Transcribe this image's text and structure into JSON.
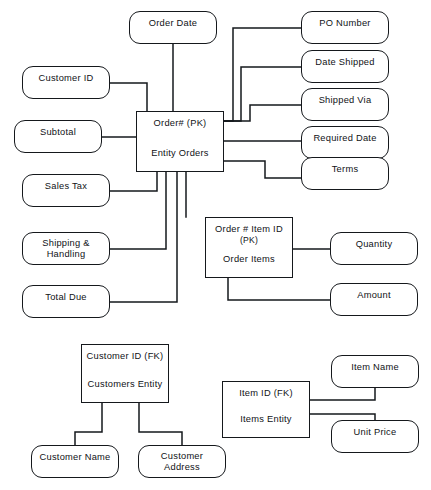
{
  "diagram": {
    "stroke_color": "#15181c",
    "background_color": "#ffffff"
  },
  "entities": [
    {
      "id": "orders",
      "key_line": "Order# (PK)",
      "name_line": "Entity Orders",
      "x": 136,
      "y": 111,
      "w": 88,
      "h": 61
    },
    {
      "id": "order_items",
      "key_line": "Order # Item ID",
      "sub_line": "(PK)",
      "name_line": "Order Items",
      "x": 205,
      "y": 217,
      "w": 88,
      "h": 61
    },
    {
      "id": "customers",
      "key_line": "Customer ID (FK)",
      "name_line": "Customers Entity",
      "x": 81,
      "y": 344,
      "w": 88,
      "h": 59
    },
    {
      "id": "items",
      "key_line": "Item ID (FK)",
      "name_line": "Items Entity",
      "x": 222,
      "y": 381,
      "w": 88,
      "h": 57
    }
  ],
  "attributes": [
    {
      "id": "order_date",
      "label": "Order Date",
      "x": 129,
      "y": 11,
      "w": 88,
      "h": 33
    },
    {
      "id": "po_number",
      "label": "PO Number",
      "x": 301,
      "y": 11,
      "w": 88,
      "h": 33
    },
    {
      "id": "date_shipped",
      "label": "Date Shipped",
      "x": 301,
      "y": 50,
      "w": 88,
      "h": 33
    },
    {
      "id": "shipped_via",
      "label": "Shipped Via",
      "x": 301,
      "y": 88,
      "w": 88,
      "h": 33
    },
    {
      "id": "required_date",
      "label": "Required Date",
      "x": 301,
      "y": 126,
      "w": 88,
      "h": 33
    },
    {
      "id": "terms",
      "label": "Terms",
      "x": 301,
      "y": 157,
      "w": 88,
      "h": 33
    },
    {
      "id": "customer_id",
      "label": "Customer ID",
      "x": 22,
      "y": 66,
      "w": 88,
      "h": 33
    },
    {
      "id": "subtotal",
      "label": "Subtotal",
      "x": 14,
      "y": 120,
      "w": 88,
      "h": 33
    },
    {
      "id": "sales_tax",
      "label": "Sales Tax",
      "x": 22,
      "y": 174,
      "w": 88,
      "h": 33
    },
    {
      "id": "shipping_handling",
      "label": "Shipping &\nHandling",
      "x": 22,
      "y": 232,
      "w": 88,
      "h": 33
    },
    {
      "id": "total_due",
      "label": "Total Due",
      "x": 22,
      "y": 285,
      "w": 88,
      "h": 33
    },
    {
      "id": "quantity",
      "label": "Quantity",
      "x": 330,
      "y": 232,
      "w": 88,
      "h": 33
    },
    {
      "id": "amount",
      "label": "Amount",
      "x": 330,
      "y": 283,
      "w": 88,
      "h": 33
    },
    {
      "id": "customer_name",
      "label": "Customer  Name",
      "x": 31,
      "y": 445,
      "w": 88,
      "h": 33
    },
    {
      "id": "customer_address",
      "label": "Customer\nAddress",
      "x": 138,
      "y": 445,
      "w": 88,
      "h": 33
    },
    {
      "id": "item_name",
      "label": "Item  Name",
      "x": 331,
      "y": 355,
      "w": 88,
      "h": 33
    },
    {
      "id": "unit_price",
      "label": "Unit Price",
      "x": 331,
      "y": 420,
      "w": 88,
      "h": 33
    }
  ],
  "connectors": [
    {
      "id": "orders-order_date",
      "from": "orders",
      "to": "order_date",
      "path": "M 173 111 L 173 44"
    },
    {
      "id": "orders-po_number",
      "from": "orders",
      "to": "po_number",
      "path": "M 224 121 L 233 121 L 233 28 L 301 28"
    },
    {
      "id": "orders-date_shipped",
      "from": "orders",
      "to": "date_shipped",
      "path": "M 224 121 L 241 121 L 241 67 L 301 67"
    },
    {
      "id": "orders-shipped_via",
      "from": "orders",
      "to": "shipped_via",
      "path": "M 224 121 L 250 121 L 250 105 L 301 105"
    },
    {
      "id": "orders-required_date",
      "from": "orders",
      "to": "required_date",
      "path": "M 224 141 L 301 141"
    },
    {
      "id": "orders-terms",
      "from": "orders",
      "to": "terms",
      "path": "M 224 161 L 265 161 L 265 178 L 301 178"
    },
    {
      "id": "orders-customer_id",
      "from": "orders",
      "to": "customer_id",
      "path": "M 110 83 L 147 83 L 147 111"
    },
    {
      "id": "orders-subtotal",
      "from": "orders",
      "to": "subtotal",
      "path": "M 102 137 L 136 137"
    },
    {
      "id": "orders-sales_tax",
      "from": "orders",
      "to": "sales_tax",
      "path": "M 110 191 L 157 191 L 157 172"
    },
    {
      "id": "orders-shipping",
      "from": "orders",
      "to": "shipping_handling",
      "path": "M 110 249 L 166 249 L 166 172"
    },
    {
      "id": "orders-total_due",
      "from": "orders",
      "to": "total_due",
      "path": "M 110 302 L 177 302 L 177 172"
    },
    {
      "id": "orders-order_items",
      "from": "orders",
      "to": "order_items",
      "path": "M 186 172 L 186 217"
    },
    {
      "id": "order_items-quantity",
      "from": "order_items",
      "to": "quantity",
      "path": "M 293 249 L 330 249"
    },
    {
      "id": "order_items-amount",
      "from": "order_items",
      "to": "amount",
      "path": "M 228 278 L 228 300 L 330 300"
    },
    {
      "id": "customers-customer_name",
      "from": "customers",
      "to": "customer_name",
      "path": "M 102 403 L 102 432 L 75 432 L 75 445"
    },
    {
      "id": "customers-customer_addr",
      "from": "customers",
      "to": "customer_address",
      "path": "M 139 403 L 139 432 L 182 432 L 182 445"
    },
    {
      "id": "items-item_name",
      "from": "items",
      "to": "item_name",
      "path": "M 310 400 L 375 400 L 375 388"
    },
    {
      "id": "items-unit_price",
      "from": "items",
      "to": "unit_price",
      "path": "M 310 414 L 375 414 L 375 420"
    }
  ]
}
